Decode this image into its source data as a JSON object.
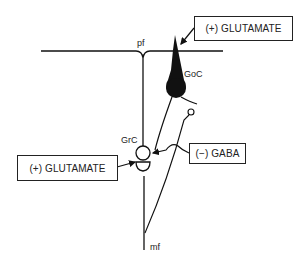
{
  "diagram": {
    "type": "neural-circuit",
    "labels": {
      "parallel_fiber": "pf",
      "golgi_cell": "GoC",
      "granule_cell": "GrC",
      "mossy_fiber": "mf"
    },
    "boxes": {
      "top_glutamate": "(+) GLUTAMATE",
      "left_glutamate": "(+) GLUTAMATE",
      "gaba": "(−) GABA"
    },
    "colors": {
      "line": "#111111",
      "background": "#ffffff"
    }
  }
}
